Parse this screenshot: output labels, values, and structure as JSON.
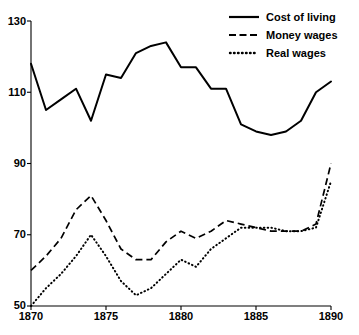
{
  "chart_data": {
    "type": "line",
    "title": "",
    "subtitle": "",
    "xlabel": "",
    "ylabel": "",
    "xlim": [
      1870,
      1890
    ],
    "ylim": [
      50,
      130
    ],
    "xticks": [
      1870,
      1875,
      1880,
      1885,
      1890
    ],
    "yticks": [
      50,
      70,
      90,
      110,
      130
    ],
    "xtick_labels": [
      "1870",
      "1875",
      "1880",
      "1885",
      "1890"
    ],
    "ytick_labels": [
      "50",
      "70",
      "90",
      "110",
      "130"
    ],
    "grid": false,
    "legend_position": "top-right",
    "x": [
      1870,
      1871,
      1872,
      1873,
      1874,
      1875,
      1876,
      1877,
      1878,
      1879,
      1880,
      1881,
      1882,
      1883,
      1884,
      1885,
      1886,
      1887,
      1888,
      1889,
      1890
    ],
    "series": [
      {
        "name": "Cost of living",
        "style": "solid",
        "color": "#000000",
        "values": [
          118,
          105,
          108,
          111,
          102,
          115,
          114,
          121,
          123,
          124,
          117,
          117,
          111,
          111,
          101,
          99,
          98,
          99,
          102,
          110,
          113
        ]
      },
      {
        "name": "Money wages",
        "style": "dashed",
        "color": "#000000",
        "values": [
          60,
          64,
          69,
          77,
          81,
          74,
          66,
          63,
          63,
          68,
          71,
          69,
          71,
          74,
          73,
          72,
          71,
          71,
          71,
          73,
          90
        ]
      },
      {
        "name": "Real wages",
        "style": "dotted",
        "color": "#000000",
        "values": [
          50,
          55,
          59,
          64,
          70,
          64,
          57,
          53,
          55,
          59,
          63,
          61,
          66,
          69,
          72,
          72,
          72,
          71,
          71,
          72,
          85
        ]
      }
    ]
  },
  "legend": {
    "items": [
      {
        "label": "Cost of living",
        "key": "solid-line-key"
      },
      {
        "label": "Money wages",
        "key": "dashed-line-key"
      },
      {
        "label": "Real wages",
        "key": "dotted-line-key"
      }
    ]
  },
  "axes": {
    "y_labels": [
      "130",
      "110",
      "90",
      "70",
      "50"
    ],
    "x_labels": [
      "1870",
      "1875",
      "1880",
      "1885",
      "1890"
    ]
  }
}
